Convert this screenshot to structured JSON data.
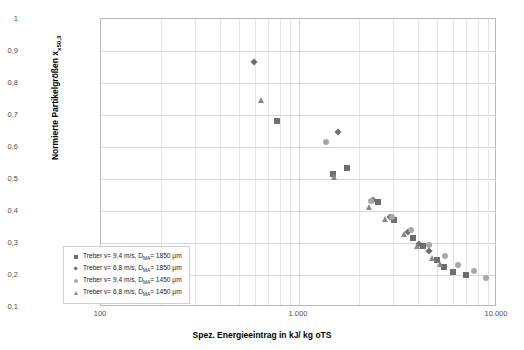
{
  "chart_data": {
    "type": "scatter",
    "title": "",
    "xlabel": "Spez. Energieeintrag in kJ/ kg oTS",
    "ylabel_text": "Normierte Partikelgrößen x",
    "ylabel_sub": "x50,3",
    "xscale": "log",
    "xlim": [
      100,
      10000
    ],
    "ylim": [
      0.1,
      1
    ],
    "grid": true,
    "legend_position": "bottom-left",
    "xticks": [
      "100",
      "1.000",
      "10.000"
    ],
    "xtick_values": [
      100,
      1000,
      10000
    ],
    "yticks": [
      "0,1",
      "0,2",
      "0,3",
      "0,4",
      "0,5",
      "0,6",
      "0,7",
      "0,8",
      "0,9",
      "1"
    ],
    "ytick_values": [
      0.1,
      0.2,
      0.3,
      0.4,
      0.5,
      0.6,
      0.7,
      0.8,
      0.9,
      1.0
    ],
    "series": [
      {
        "name": "Treber v= 9,4 m/s, D",
        "name_sub": "MA",
        "name_tail": "= 1850 µm",
        "marker": "square",
        "color": "#6e6e6e",
        "points": [
          [
            780,
            0.678
          ],
          [
            1500,
            0.513
          ],
          [
            1760,
            0.532
          ],
          [
            2550,
            0.424
          ],
          [
            3050,
            0.368
          ],
          [
            3800,
            0.313
          ],
          [
            4300,
            0.288
          ],
          [
            5050,
            0.245
          ],
          [
            5450,
            0.222
          ],
          [
            6100,
            0.205
          ],
          [
            7050,
            0.196
          ]
        ]
      },
      {
        "name": "Treber v= 6,8 m/s, D",
        "name_sub": "MA",
        "name_tail": "= 1850 µm",
        "marker": "diamond",
        "color": "#6e6e6e",
        "points": [
          [
            600,
            0.862
          ],
          [
            1600,
            0.645
          ],
          [
            2400,
            0.432
          ],
          [
            2900,
            0.378
          ],
          [
            3600,
            0.33
          ],
          [
            4100,
            0.295
          ],
          [
            4600,
            0.272
          ]
        ]
      },
      {
        "name": "Treber v= 9,4 m/s, D",
        "name_sub": "MA",
        "name_tail": "= 1450 µm",
        "marker": "circle",
        "color": "#a8a8a8",
        "points": [
          [
            1380,
            0.612
          ],
          [
            2340,
            0.428
          ],
          [
            3000,
            0.377
          ],
          [
            3700,
            0.339
          ],
          [
            4600,
            0.292
          ],
          [
            5550,
            0.256
          ],
          [
            6400,
            0.228
          ],
          [
            7700,
            0.21
          ],
          [
            8900,
            0.186
          ]
        ]
      },
      {
        "name": "Treber v= 6,8 m/s, D",
        "name_sub": "MA",
        "name_tail": "= 1450 µm",
        "marker": "triangle",
        "color": "#8a8a8a",
        "points": [
          [
            650,
            0.745
          ],
          [
            1520,
            0.502
          ],
          [
            2290,
            0.408
          ],
          [
            2750,
            0.372
          ],
          [
            3450,
            0.325
          ],
          [
            4000,
            0.288
          ],
          [
            4750,
            0.251
          ],
          [
            5200,
            0.232
          ]
        ]
      }
    ]
  }
}
